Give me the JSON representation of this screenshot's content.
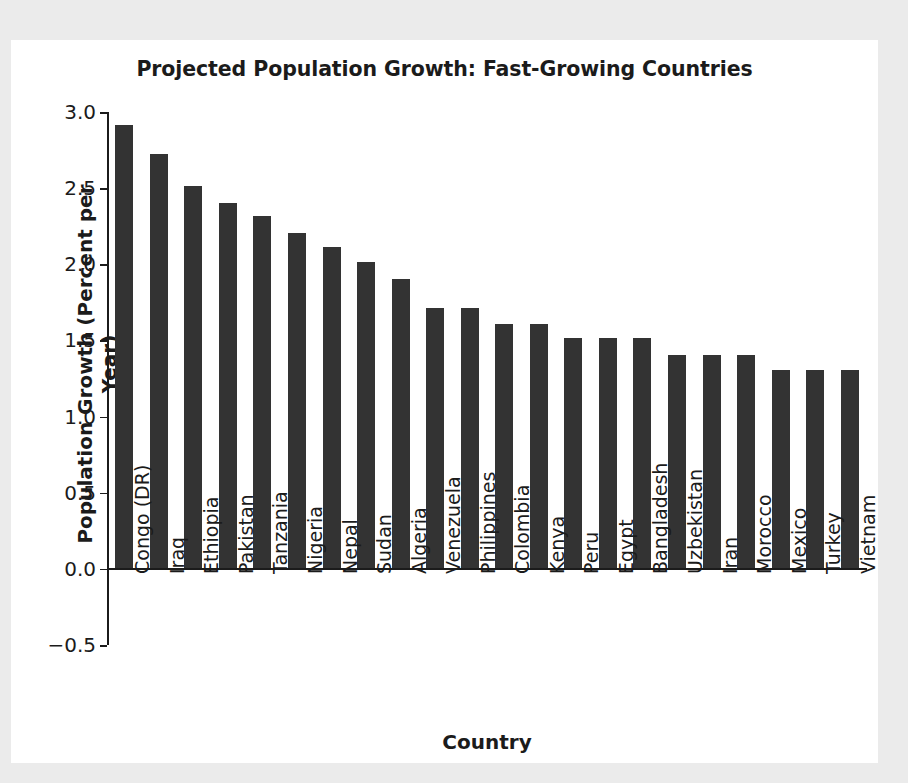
{
  "figure": {
    "background_color": "#ebebeb",
    "card_color": "#ffffff",
    "bar_color": "#333333",
    "axis_color": "#1b1b1b"
  },
  "chart_data": {
    "type": "bar",
    "title": "Projected Population Growth: Fast-Growing Countries",
    "xlabel": "Country",
    "ylabel": "Population Growth (Percent per Year)",
    "ylim": [
      -0.5,
      3.0
    ],
    "yticks": [
      -0.5,
      0.0,
      0.5,
      1.0,
      1.5,
      2.0,
      2.5,
      3.0
    ],
    "ytick_labels": [
      "−0.5",
      "0.0",
      "0.5",
      "1.0",
      "1.5",
      "2.0",
      "2.5",
      "3.0"
    ],
    "grid": false,
    "legend": null,
    "categories": [
      "Congo (DR)",
      "Iraq",
      "Ethiopia",
      "Pakistan",
      "Tanzania",
      "Nigeria",
      "Nepal",
      "Sudan",
      "Algeria",
      "Venezuela",
      "Philippines",
      "Colombia",
      "Kenya",
      "Peru",
      "Egypt",
      "Bangladesh",
      "Uzbekistan",
      "Iran",
      "Morocco",
      "Mexico",
      "Turkey",
      "Vietnam"
    ],
    "values": [
      2.91,
      2.72,
      2.51,
      2.4,
      2.31,
      2.2,
      2.11,
      2.01,
      1.9,
      1.71,
      1.71,
      1.6,
      1.6,
      1.51,
      1.51,
      1.51,
      1.4,
      1.4,
      1.4,
      1.3,
      1.3,
      1.3
    ]
  }
}
